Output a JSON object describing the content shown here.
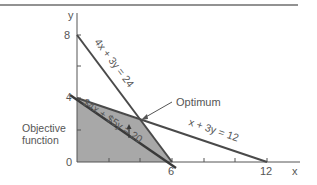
{
  "diagram": {
    "type": "linear-programming-graph",
    "axes": {
      "x_label": "x",
      "y_label": "y",
      "x_ticks": [
        "6",
        "12"
      ],
      "y_ticks": [
        "8",
        "4"
      ],
      "origin": "0"
    },
    "constraints": [
      {
        "label": "4x + 3y = 24",
        "intercepts": {
          "x": 6,
          "y": 8
        }
      },
      {
        "label": "x + 3y = 12",
        "intercepts": {
          "x": 12,
          "y": 4
        }
      }
    ],
    "objective": {
      "label": "$4x + $5y = 20",
      "caption_line1": "Objective",
      "caption_line2": "function"
    },
    "optimum": {
      "label": "Optimum",
      "x": 4,
      "y": 2.67
    },
    "feasible_region_vertices": [
      [
        0,
        0
      ],
      [
        0,
        4
      ],
      [
        4,
        2.67
      ],
      [
        6,
        0
      ]
    ],
    "colors": {
      "line": "#4a4a4a",
      "shade": "#a8a8a8",
      "text": "#555555",
      "border": "#6e6e6e"
    }
  }
}
